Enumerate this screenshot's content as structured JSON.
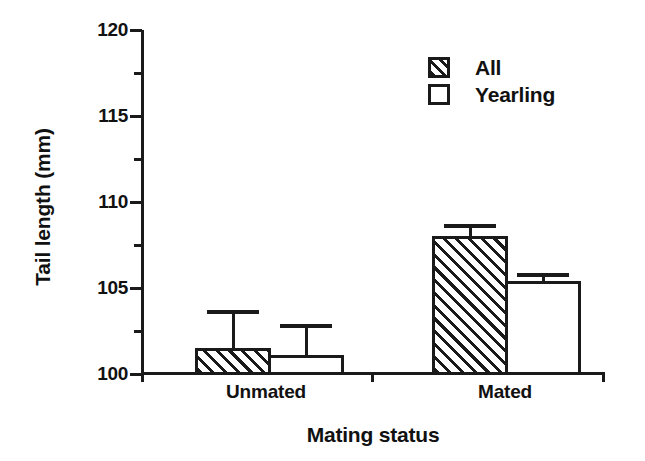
{
  "chart_data": {
    "type": "bar",
    "title": "",
    "xlabel": "Mating status",
    "ylabel": "Tail length (mm)",
    "categories": [
      "Unmated",
      "Mated"
    ],
    "ylim": [
      100,
      120
    ],
    "ytick_labels": [
      "100",
      "105",
      "110",
      "115",
      "120"
    ],
    "ytick_values": [
      100,
      105,
      110,
      115,
      120
    ],
    "yminor_tick_values": [
      102.5,
      107.5,
      112.5,
      117.5
    ],
    "grid": false,
    "legend_position": "top-right",
    "series": [
      {
        "name": "All",
        "fill": "hatched",
        "values": [
          101.5,
          108.0
        ],
        "error_upper": [
          103.7,
          108.7
        ]
      },
      {
        "name": "Yearling",
        "fill": "white",
        "values": [
          101.1,
          105.4
        ],
        "error_upper": [
          102.9,
          105.9
        ]
      }
    ]
  },
  "legend": {
    "items": [
      {
        "label": "All",
        "fill": "hatched"
      },
      {
        "label": "Yearling",
        "fill": "white"
      }
    ]
  },
  "colors": {
    "ink": "#1a1a1a",
    "background": "#ffffff"
  }
}
